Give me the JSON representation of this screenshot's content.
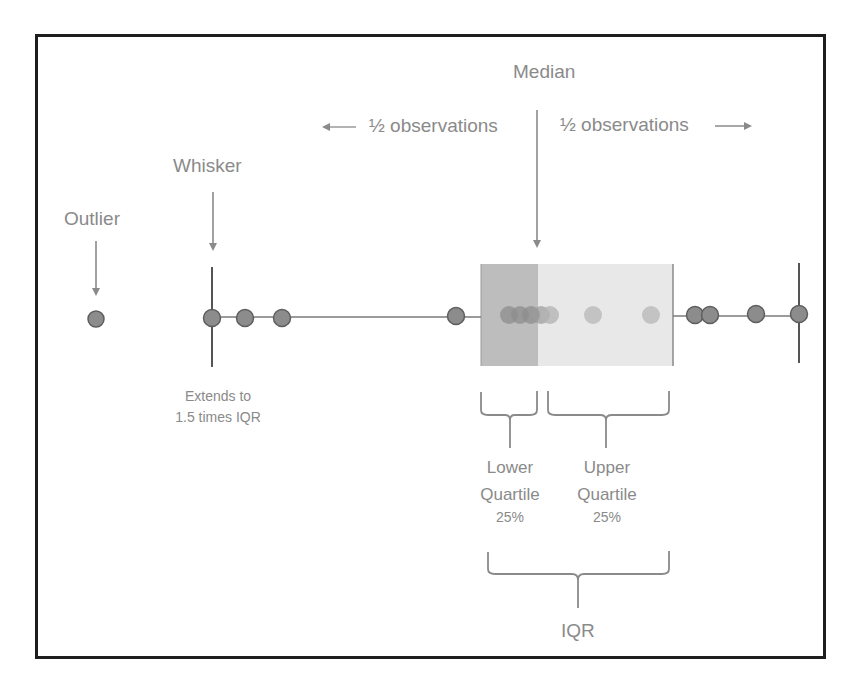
{
  "labels": {
    "median": "Median",
    "half_left": "½ observations",
    "half_right": "½ observations",
    "whisker": "Whisker",
    "outlier": "Outlier",
    "whisker_note_line1": "Extends to",
    "whisker_note_line2": "1.5 times IQR",
    "lower_quartile_line1": "Lower",
    "lower_quartile_line2": "Quartile",
    "lower_quartile_pct": "25%",
    "upper_quartile_line1": "Upper",
    "upper_quartile_line2": "Quartile",
    "upper_quartile_pct": "25%",
    "iqr": "IQR"
  },
  "colors": {
    "text": "#8a8a8a",
    "frame": "#1e1e1e",
    "line": "#7a7a7a",
    "dot_fill": "#8c8c8c",
    "dot_stroke": "#5e5e5e",
    "lower_box": "#bdbdbd",
    "upper_box": "#e8e8e8"
  },
  "diagram": {
    "axis_y": 317,
    "outlier_x": 96,
    "left_whisker_x": 212,
    "right_whisker_x": 799,
    "box_left_x": 481,
    "median_x": 538,
    "box_right_x": 673,
    "box_top_y": 264,
    "box_bottom_y": 366,
    "points_outside": [
      96,
      212,
      245,
      282,
      456,
      695,
      710,
      756,
      799
    ],
    "points_inside": [
      509,
      520,
      531,
      541,
      550,
      593,
      651
    ]
  }
}
